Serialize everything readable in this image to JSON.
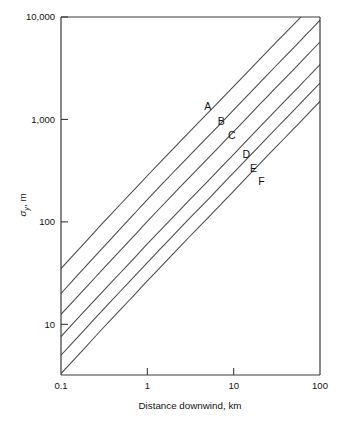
{
  "figure": {
    "name": "sigma-y-vs-distance-downwind",
    "background": "#ffffff",
    "ink_color": "#3a3a3a"
  },
  "chart_data": {
    "type": "line",
    "title": "",
    "subtitle": "",
    "xlabel": "Distance downwind, km",
    "ylabel": "σy, m",
    "ylabel_symbol": "σ",
    "ylabel_subscript": "y",
    "ylabel_units": "m",
    "xscale": "log",
    "yscale": "log",
    "xlim": [
      0.1,
      100
    ],
    "ylim": [
      3.2,
      10000
    ],
    "grid": false,
    "legend": "inline-labels",
    "legend_position": "on-curves",
    "xticks": [
      0.1,
      1,
      10,
      100
    ],
    "xticklabels": [
      "0.1",
      "1",
      "10",
      "100"
    ],
    "yticks": [
      10,
      100,
      1000,
      10000
    ],
    "yticklabels": [
      "10",
      "100",
      "1,000",
      "10,000"
    ],
    "x": [
      0.1,
      0.2,
      0.3,
      0.5,
      0.7,
      1,
      2,
      3,
      5,
      7,
      10,
      20,
      30,
      50,
      70,
      100
    ],
    "series": [
      {
        "name": "A",
        "label": "A",
        "label_x": 5.0,
        "label_y": 1250,
        "values": [
          35,
          66,
          96,
          152,
          205,
          282,
          520,
          740,
          1150,
          1540,
          2100,
          3850,
          5500,
          8500,
          11500,
          15500
        ]
      },
      {
        "name": "B",
        "label": "B",
        "label_x": 7.2,
        "label_y": 880,
        "values": [
          20,
          38,
          55,
          88,
          119,
          165,
          305,
          434,
          675,
          905,
          1240,
          2280,
          3250,
          5050,
          6800,
          9300
        ]
      },
      {
        "name": "C",
        "label": "C",
        "label_x": 9.5,
        "label_y": 640,
        "values": [
          12.5,
          23.5,
          34,
          54,
          73,
          101,
          187,
          266,
          414,
          556,
          760,
          1400,
          1995,
          3100,
          4180,
          5700
        ]
      },
      {
        "name": "D",
        "label": "D",
        "label_x": 14,
        "label_y": 420,
        "values": [
          7.6,
          14.3,
          20.6,
          32.6,
          44,
          61,
          112,
          160,
          249,
          334,
          457,
          840,
          1200,
          1865,
          2510,
          3430
        ]
      },
      {
        "name": "E",
        "label": "E",
        "label_x": 17,
        "label_y": 305,
        "values": [
          5.0,
          9.4,
          13.6,
          21.5,
          29,
          40,
          74,
          106,
          164,
          221,
          302,
          556,
          793,
          1232,
          1660,
          2265
        ]
      },
      {
        "name": "F",
        "label": "F",
        "label_x": 21,
        "label_y": 228,
        "values": [
          3.3,
          6.2,
          9.0,
          14.2,
          19.2,
          26.5,
          49,
          70,
          109,
          146,
          200,
          368,
          525,
          816,
          1098,
          1500
        ]
      }
    ]
  }
}
